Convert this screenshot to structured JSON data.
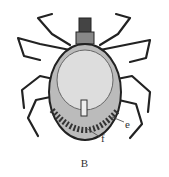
{
  "figure": {
    "labels": [
      {
        "id": "e",
        "text": "e"
      },
      {
        "id": "f",
        "text": "f"
      }
    ],
    "caption": "B"
  }
}
